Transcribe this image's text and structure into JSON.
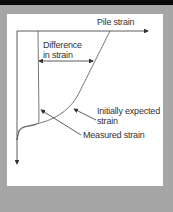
{
  "diagram": {
    "x_axis_label": "Pile strain",
    "difference_label_line1": "Difference",
    "difference_label_line2": "in strain",
    "expected_label_line1": "Initially expected",
    "expected_label_line2": "strain",
    "measured_label": "Measured strain",
    "colors": {
      "background": "#a6a6a6",
      "panel": "#ffffff",
      "topbar": "#0a0a0a",
      "lines": "#333333"
    }
  }
}
